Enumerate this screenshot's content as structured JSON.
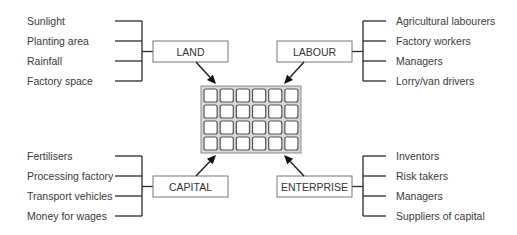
{
  "diagram": {
    "center": {
      "name": "production-unit",
      "grid": {
        "cols": 6,
        "rows": 4,
        "x": 201,
        "y": 86,
        "w": 100,
        "h": 67
      }
    },
    "factors": [
      {
        "id": "land",
        "label": "LAND",
        "side": "left",
        "box": {
          "x": 153,
          "y": 41,
          "w": 75,
          "h": 21
        },
        "items": [
          "Sunlight",
          "Planting area",
          "Rainfall",
          "Factory space"
        ],
        "item_y": [
          21,
          41,
          61,
          81
        ],
        "text_x": 27,
        "line_from_x": 115,
        "bracket_x": 142,
        "arrow": {
          "x1": 196,
          "y1": 62,
          "x2": 216,
          "y2": 84
        }
      },
      {
        "id": "labour",
        "label": "LABOUR",
        "side": "right",
        "box": {
          "x": 277,
          "y": 41,
          "w": 75,
          "h": 21
        },
        "items": [
          "Agricultural labourers",
          "Factory workers",
          "Managers",
          "Lorry/van drivers"
        ],
        "item_y": [
          21,
          41,
          61,
          81
        ],
        "text_x": 396,
        "line_to_x": 386,
        "bracket_x": 363,
        "arrow": {
          "x1": 304,
          "y1": 62,
          "x2": 284,
          "y2": 84
        }
      },
      {
        "id": "capital",
        "label": "CAPITAL",
        "side": "left",
        "box": {
          "x": 153,
          "y": 176,
          "w": 75,
          "h": 21
        },
        "items": [
          "Fertilisers",
          "Processing factory",
          "Transport vehicles",
          "Money for wages"
        ],
        "item_y": [
          156,
          176,
          196,
          216
        ],
        "text_x": 27,
        "line_from_x": 115,
        "bracket_x": 142,
        "arrow": {
          "x1": 196,
          "y1": 176,
          "x2": 216,
          "y2": 155
        }
      },
      {
        "id": "enterprise",
        "label": "ENTERPRISE",
        "side": "right",
        "box": {
          "x": 277,
          "y": 176,
          "w": 75,
          "h": 21
        },
        "items": [
          "Inventors",
          "Risk takers",
          "Managers",
          "Suppliers of capital"
        ],
        "item_y": [
          156,
          176,
          196,
          216
        ],
        "text_x": 396,
        "line_to_x": 386,
        "bracket_x": 363,
        "arrow": {
          "x1": 304,
          "y1": 176,
          "x2": 284,
          "y2": 155
        }
      }
    ]
  }
}
